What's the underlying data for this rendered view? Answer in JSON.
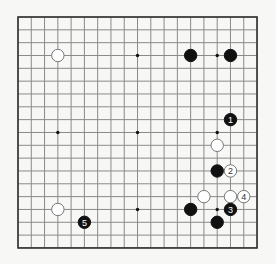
{
  "board": {
    "size": 19,
    "origin_x": 18,
    "origin_y": 17,
    "step_x": 13.28,
    "step_y": 12.83,
    "line_color": "#8a8a8a",
    "border_color": "#333333",
    "background": "#f7f7f5",
    "hoshi": [
      [
        3,
        3
      ],
      [
        9,
        3
      ],
      [
        15,
        3
      ],
      [
        3,
        9
      ],
      [
        9,
        9
      ],
      [
        15,
        9
      ],
      [
        3,
        15
      ],
      [
        9,
        15
      ],
      [
        15,
        15
      ]
    ],
    "stones": [
      {
        "color": "white",
        "col": 3,
        "row": 3,
        "label": ""
      },
      {
        "color": "black",
        "col": 13,
        "row": 3,
        "label": ""
      },
      {
        "color": "black",
        "col": 16,
        "row": 3,
        "label": ""
      },
      {
        "color": "black",
        "col": 16,
        "row": 8,
        "label": "1"
      },
      {
        "color": "white",
        "col": 15,
        "row": 10,
        "label": ""
      },
      {
        "color": "black",
        "col": 15,
        "row": 12,
        "label": ""
      },
      {
        "color": "white",
        "col": 16,
        "row": 12,
        "label": "2"
      },
      {
        "color": "white",
        "col": 14,
        "row": 14,
        "label": ""
      },
      {
        "color": "white",
        "col": 16,
        "row": 14,
        "label": ""
      },
      {
        "color": "white",
        "col": 17,
        "row": 14,
        "label": "4"
      },
      {
        "color": "black",
        "col": 13,
        "row": 15,
        "label": ""
      },
      {
        "color": "black",
        "col": 16,
        "row": 15,
        "label": "3"
      },
      {
        "color": "black",
        "col": 15,
        "row": 16,
        "label": ""
      },
      {
        "color": "white",
        "col": 3,
        "row": 15,
        "label": ""
      },
      {
        "color": "black",
        "col": 5,
        "row": 16,
        "label": "5"
      }
    ]
  }
}
